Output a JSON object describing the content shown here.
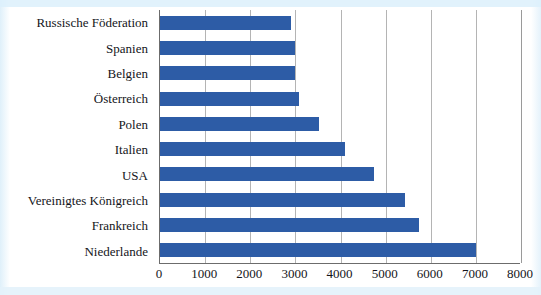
{
  "chart_data": {
    "type": "bar",
    "orientation": "horizontal",
    "title": "",
    "xlabel": "",
    "ylabel": "",
    "xlim": [
      0,
      8000
    ],
    "xticks": [
      0,
      1000,
      2000,
      3000,
      4000,
      5000,
      6000,
      7000,
      8000
    ],
    "xtick_labels": [
      "0",
      "1000",
      "2000",
      "3000",
      "4000",
      "5000",
      "6000",
      "7000",
      "8000"
    ],
    "grid": true,
    "legend": null,
    "bar_color": "#2d5ca6",
    "gridline_color": "#b4b4b4",
    "axis_color": "#6c6c6c",
    "categories": [
      "Russische Föderation",
      "Spanien",
      "Belgien",
      "Österreich",
      "Polen",
      "Italien",
      "USA",
      "Vereinigtes Königreich",
      "Frankreich",
      "Niederlande"
    ],
    "values": [
      2900,
      3000,
      3000,
      3080,
      3530,
      4100,
      4740,
      5430,
      5750,
      7000
    ]
  }
}
